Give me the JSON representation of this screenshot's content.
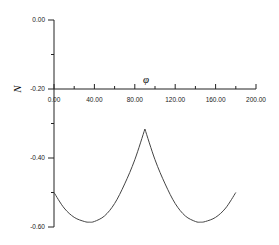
{
  "chart_data": {
    "type": "line",
    "title": "",
    "xlabel": "φ",
    "ylabel": "N",
    "xlim": [
      0,
      200
    ],
    "ylim": [
      -0.6,
      0.0
    ],
    "x_ticks": [
      "0.00",
      "40.00",
      "80.00",
      "120.00",
      "160.00",
      "200.00"
    ],
    "y_ticks": [
      "0.00",
      "-0.20",
      "-0.40",
      "-0.60"
    ],
    "grid": false,
    "legend": null,
    "series": [
      {
        "name": "N(φ)",
        "x": [
          0,
          10,
          20,
          30,
          35,
          40,
          50,
          60,
          70,
          80,
          90,
          100,
          110,
          120,
          130,
          140,
          145,
          150,
          160,
          170,
          180
        ],
        "y": [
          -0.5,
          -0.545,
          -0.572,
          -0.584,
          -0.586,
          -0.584,
          -0.568,
          -0.532,
          -0.475,
          -0.405,
          -0.316,
          -0.405,
          -0.475,
          -0.532,
          -0.568,
          -0.584,
          -0.586,
          -0.584,
          -0.572,
          -0.545,
          -0.5
        ]
      }
    ]
  }
}
